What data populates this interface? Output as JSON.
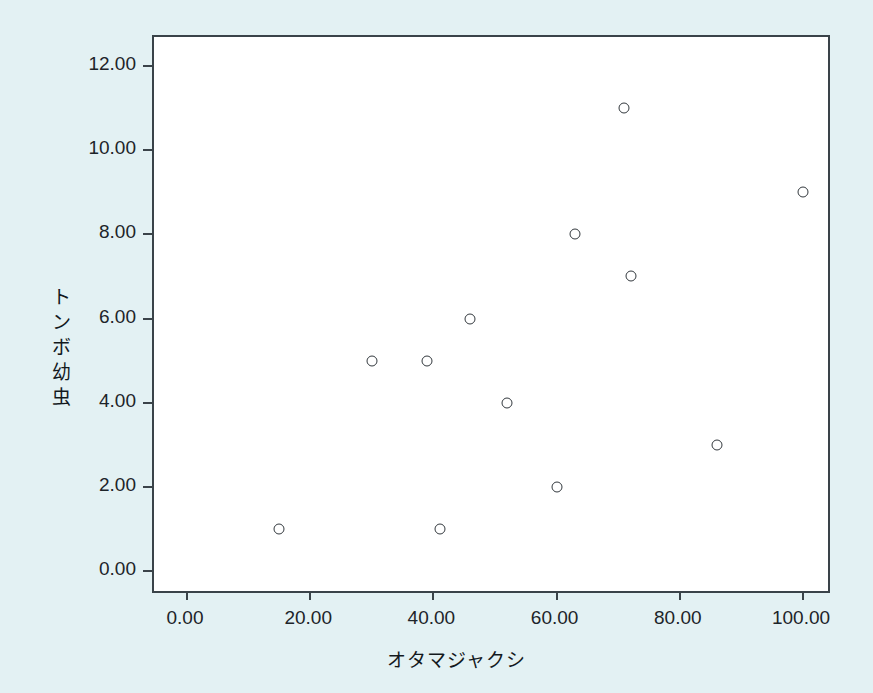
{
  "chart_data": {
    "type": "scatter",
    "title": "",
    "xlabel": "オタマジャクシ",
    "ylabel": "トンボ幼虫",
    "xlim": [
      0,
      105
    ],
    "ylim": [
      0,
      12.6
    ],
    "xticks": [
      0,
      20,
      40,
      60,
      80,
      100
    ],
    "yticks": [
      0,
      2,
      4,
      6,
      8,
      10,
      12
    ],
    "xtick_labels": [
      "0.00",
      "20.00",
      "40.00",
      "60.00",
      "80.00",
      "100.00"
    ],
    "ytick_labels": [
      "0.00",
      "2.00",
      "4.00",
      "6.00",
      "8.00",
      "10.00",
      "12.00"
    ],
    "grid": false,
    "legend": false,
    "marker": "open-circle",
    "marker_color": "#32383d",
    "points": [
      {
        "x": 15,
        "y": 1
      },
      {
        "x": 30,
        "y": 5
      },
      {
        "x": 39,
        "y": 5
      },
      {
        "x": 41,
        "y": 1
      },
      {
        "x": 46,
        "y": 6
      },
      {
        "x": 52,
        "y": 4
      },
      {
        "x": 60,
        "y": 2
      },
      {
        "x": 63,
        "y": 8
      },
      {
        "x": 71,
        "y": 11
      },
      {
        "x": 72,
        "y": 7
      },
      {
        "x": 86,
        "y": 3
      },
      {
        "x": 100,
        "y": 9
      }
    ]
  },
  "style": {
    "background": "#e3f1f3",
    "plot_background": "#ffffff",
    "axis_color": "#3a4349",
    "text_color": "#13191d"
  }
}
